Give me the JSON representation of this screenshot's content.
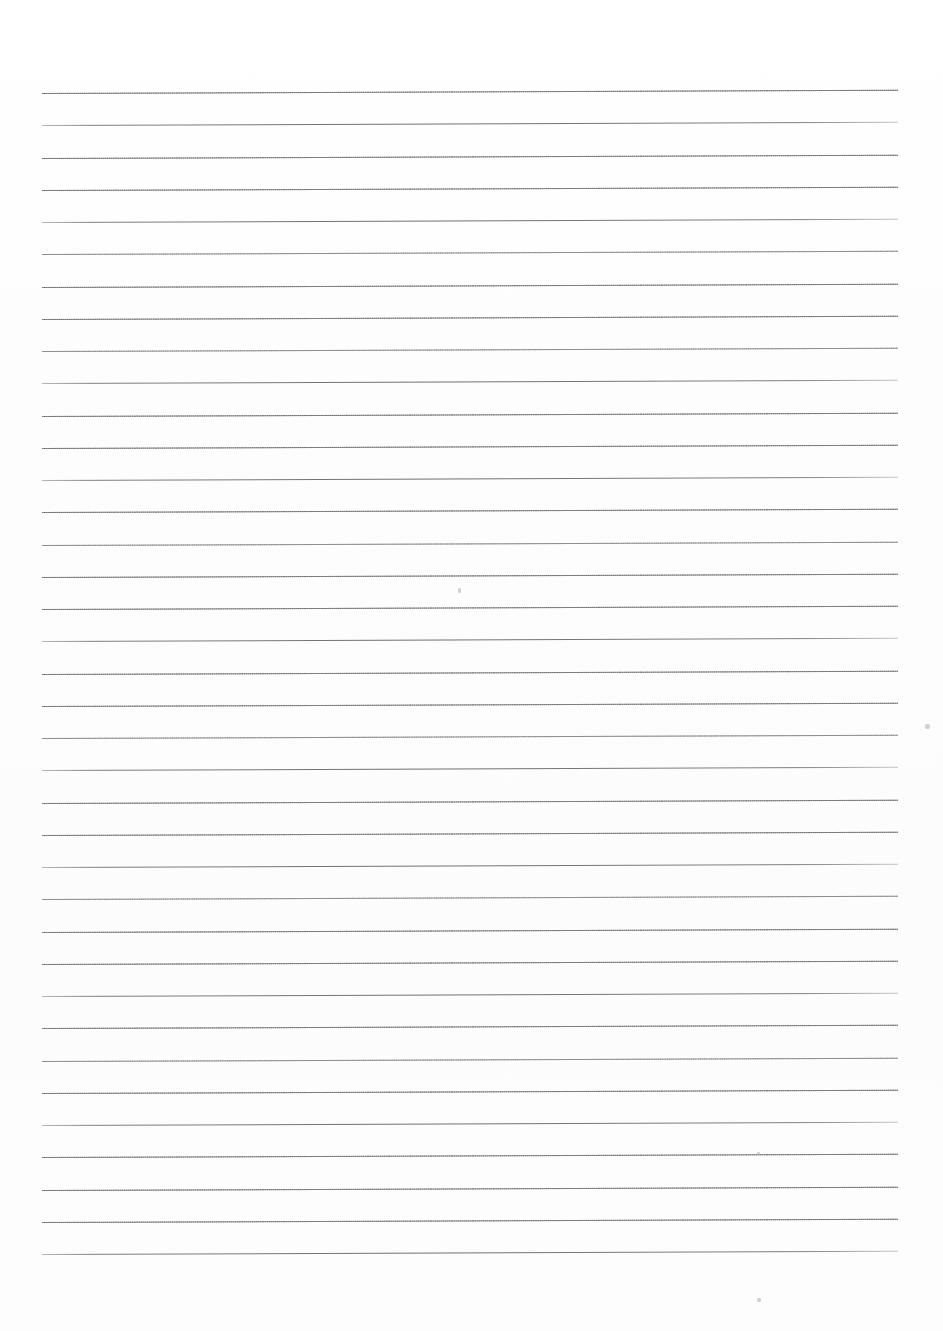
{
  "page": {
    "kind": "scanned-ruled-notebook-paper",
    "width": 943,
    "height": 1331,
    "background_color": "#fdfdfd",
    "content": "",
    "visible_text": ""
  },
  "ruling": {
    "line_color": "#8d8f92",
    "line_count": 37,
    "first_line_y": 93,
    "line_spacing": 32.25,
    "left_margin_x": 42,
    "right_margin_x": 898,
    "line_length": 856,
    "skew_degrees": -0.22,
    "top_margin": 93,
    "bottom_margin": 74,
    "weights": [
      "dotted",
      "solid",
      "dotted",
      "dotted",
      "solid",
      "faint",
      "dotted",
      "dotted",
      "faint",
      "solid",
      "dotted",
      "dotted",
      "solid",
      "dotted",
      "faint",
      "dotted",
      "dotted",
      "solid",
      "dotted",
      "dotted",
      "faint",
      "solid",
      "dotted",
      "dotted",
      "solid",
      "faint",
      "dotted",
      "dotted",
      "solid",
      "dotted",
      "faint",
      "dotted",
      "solid",
      "dotted",
      "dotted",
      "dotted",
      "solid"
    ]
  },
  "specks": [
    {
      "x": 458,
      "y": 588,
      "w": 3,
      "h": 5
    },
    {
      "x": 925,
      "y": 724,
      "w": 5,
      "h": 5
    },
    {
      "x": 757,
      "y": 1298,
      "w": 4,
      "h": 4
    },
    {
      "x": 757,
      "y": 1152,
      "w": 3,
      "h": 3
    }
  ]
}
